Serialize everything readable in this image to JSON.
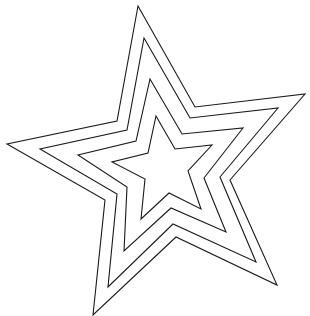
{
  "image": {
    "description": "Line drawing of four concentric nested five-pointed star outlines",
    "width": 310,
    "height": 316,
    "background": "#ffffff",
    "stroke_color": "#1a1a1a"
  },
  "stars": [
    {
      "name": "outer",
      "points": "138,6 195,107 305,94 230,180 277,285 176,237 93,315 105,200 7,144 117,121"
    },
    {
      "name": "second",
      "points": "144,38 190,118 278,108 220,177 256,262 173,224 108,287 117,194 40,149 127,130"
    },
    {
      "name": "third",
      "points": "150,79 182,134 243,128 204,178 226,232 171,208 124,251 127,187 78,155 136,141"
    },
    {
      "name": "inner",
      "points": "156,116 175,149 212,145 188,171 201,209 169,193 141,219 145,179 112,162 148,153"
    }
  ]
}
